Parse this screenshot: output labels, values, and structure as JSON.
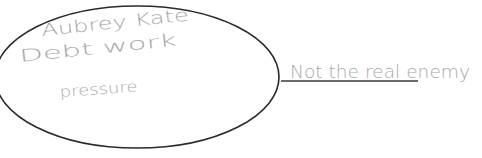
{
  "ellipse": {
    "lines": [
      "Aubrey   Kate",
      "Debt    work",
      "pressure"
    ],
    "stroke_color": "#2a2a2a"
  },
  "label": {
    "text": "Not the real enemy",
    "underline_color": "#3a3a3a",
    "text_color": "#a8a8a8"
  }
}
